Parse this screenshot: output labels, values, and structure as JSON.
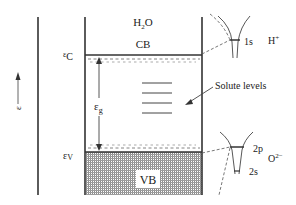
{
  "diagram": {
    "title_molecule": "H",
    "title_molecule_sub": "2",
    "title_molecule_tail": "O",
    "conduction_band": "CB",
    "valence_band": "VB",
    "epsilon_axis": "ε",
    "ec_label": "ε",
    "ec_sub": "C",
    "ev_label": "ε",
    "ev_sub": "V",
    "eg_label": "ε",
    "eg_sub": "g",
    "solute_levels_label": "Solute levels",
    "solute_level_count": 4,
    "hydrogen": {
      "ion": "H",
      "ion_sup": "+",
      "level": "1s"
    },
    "oxygen": {
      "ion": "O",
      "ion_sup": "2−",
      "upper_level": "2p",
      "lower_level": "2s"
    },
    "colors": {
      "line": "#333333",
      "shade": "#9a9a9a",
      "background": "#ffffff"
    }
  }
}
